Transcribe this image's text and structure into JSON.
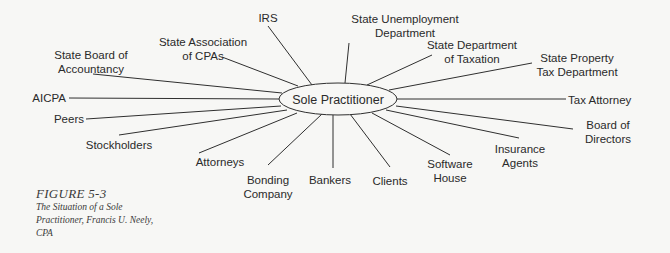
{
  "diagram": {
    "type": "hub-and-spoke",
    "colors": {
      "background": "#f7f7f5",
      "line": "#2f2f2f",
      "text": "#2a2a2a"
    },
    "hub": {
      "label": "Sole Practitioner",
      "cx": 338,
      "cy": 99,
      "rx": 59,
      "ry": 16
    },
    "nodes": [
      {
        "id": "irs",
        "lines": [
          "IRS"
        ],
        "x": 268,
        "y": 22,
        "anchor": "middle",
        "line_from": [
          268,
          26
        ],
        "line_to": [
          312,
          85
        ]
      },
      {
        "id": "state-unemployment",
        "lines": [
          "State Unemployment",
          "Department"
        ],
        "x": 405,
        "y": 23,
        "anchor": "middle",
        "line_from": [
          349,
          43
        ],
        "line_to": [
          345,
          83
        ]
      },
      {
        "id": "state-association-cpas",
        "lines": [
          "State Association",
          "of CPAs"
        ],
        "x": 203,
        "y": 46,
        "anchor": "middle",
        "line_from": [
          222,
          57
        ],
        "line_to": [
          298,
          86
        ]
      },
      {
        "id": "state-board-accountancy",
        "lines": [
          "State Board of",
          "Accountancy"
        ],
        "x": 91,
        "y": 59,
        "anchor": "middle",
        "line_from": [
          93,
          74
        ],
        "line_to": [
          282,
          93
        ]
      },
      {
        "id": "state-dept-taxation",
        "lines": [
          "State Department",
          "of Taxation"
        ],
        "x": 472,
        "y": 49,
        "anchor": "middle",
        "line_from": [
          432,
          55
        ],
        "line_to": [
          367,
          85
        ]
      },
      {
        "id": "state-property-tax",
        "lines": [
          "State Property",
          "Tax Department"
        ],
        "x": 577,
        "y": 62,
        "anchor": "middle",
        "line_from": [
          532,
          63
        ],
        "line_to": [
          389,
          90
        ]
      },
      {
        "id": "aicpa",
        "lines": [
          "AICPA"
        ],
        "x": 66,
        "y": 102,
        "anchor": "end",
        "line_from": [
          69,
          98
        ],
        "line_to": [
          279,
          99
        ]
      },
      {
        "id": "tax-attorney",
        "lines": [
          "Tax Attorney"
        ],
        "x": 568,
        "y": 104,
        "anchor": "start",
        "line_from": [
          397,
          99
        ],
        "line_to": [
          566,
          99
        ]
      },
      {
        "id": "peers",
        "lines": [
          "Peers"
        ],
        "x": 84,
        "y": 123,
        "anchor": "end",
        "line_from": [
          86,
          119
        ],
        "line_to": [
          281,
          106
        ]
      },
      {
        "id": "board-of-directors",
        "lines": [
          "Board of",
          "Directors"
        ],
        "x": 608,
        "y": 129,
        "anchor": "middle",
        "line_from": [
          396,
          106
        ],
        "line_to": [
          573,
          129
        ]
      },
      {
        "id": "stockholders",
        "lines": [
          "Stockholders"
        ],
        "x": 119,
        "y": 149,
        "anchor": "middle",
        "line_from": [
          119,
          135
        ],
        "line_to": [
          287,
          110
        ]
      },
      {
        "id": "insurance-agents",
        "lines": [
          "Insurance",
          "Agents"
        ],
        "x": 520,
        "y": 153,
        "anchor": "middle",
        "line_from": [
          386,
          110
        ],
        "line_to": [
          519,
          138
        ]
      },
      {
        "id": "attorneys",
        "lines": [
          "Attorneys"
        ],
        "x": 220,
        "y": 166,
        "anchor": "middle",
        "line_from": [
          199,
          153
        ],
        "line_to": [
          297,
          113
        ]
      },
      {
        "id": "software-house",
        "lines": [
          "Software",
          "House"
        ],
        "x": 450,
        "y": 168,
        "anchor": "middle",
        "line_from": [
          372,
          113
        ],
        "line_to": [
          450,
          155
        ]
      },
      {
        "id": "bonding-company",
        "lines": [
          "Bonding",
          "Company"
        ],
        "x": 268,
        "y": 184,
        "anchor": "middle",
        "line_from": [
          268,
          165
        ],
        "line_to": [
          322,
          114
        ]
      },
      {
        "id": "bankers",
        "lines": [
          "Bankers"
        ],
        "x": 330,
        "y": 184,
        "anchor": "middle",
        "line_from": [
          333,
          168
        ],
        "line_to": [
          333,
          115
        ]
      },
      {
        "id": "clients",
        "lines": [
          "Clients"
        ],
        "x": 390,
        "y": 185,
        "anchor": "middle",
        "line_from": [
          390,
          167
        ],
        "line_to": [
          350,
          114
        ]
      }
    ]
  },
  "caption": {
    "figure_label": "FIGURE 5-3",
    "text_lines": [
      "The Situation of a Sole",
      "Practitioner, Francis U. Neely,",
      "CPA"
    ]
  }
}
